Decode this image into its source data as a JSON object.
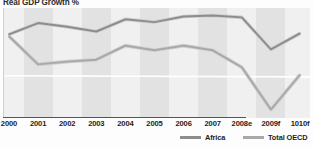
{
  "chart": {
    "title": "Real GDP Growth %"
  },
  "legend": {
    "position": "bottom-right",
    "items": [
      {
        "label": "Africa",
        "color": "#8d8d8d"
      },
      {
        "label": "Total OECD",
        "color": "#a8a8a8"
      }
    ]
  },
  "style": {
    "plot_background": "#eeeeee",
    "band_light": "#f0f0f0",
    "band_dark": "#e2e2e2",
    "zero_line_color": "#ffffff",
    "axis_color": "#555555",
    "title_color": "#2b2b2b",
    "label_color": "#1d1d1d"
  },
  "chart_data": {
    "type": "line",
    "title": "Real GDP Growth %",
    "xlabel": "",
    "ylabel": "",
    "grid": false,
    "zero_line": 0,
    "legend_position": "bottom-right",
    "ylim": [
      -4.5,
      7.2
    ],
    "categories": [
      "2000",
      "2001",
      "2002",
      "2003",
      "2004",
      "2005",
      "2006",
      "2007",
      "2008e",
      "2009f",
      "1010f"
    ],
    "series": [
      {
        "name": "Africa",
        "color": "#8d8d8d",
        "values": [
          4.4,
          5.6,
          5.2,
          4.7,
          6.0,
          5.7,
          6.3,
          6.4,
          6.2,
          2.8,
          4.5
        ]
      },
      {
        "name": "Total OECD",
        "color": "#a8a8a8",
        "values": [
          4.2,
          1.2,
          1.5,
          1.7,
          3.2,
          2.7,
          3.2,
          2.7,
          0.9,
          -3.6,
          0.1
        ]
      }
    ]
  }
}
